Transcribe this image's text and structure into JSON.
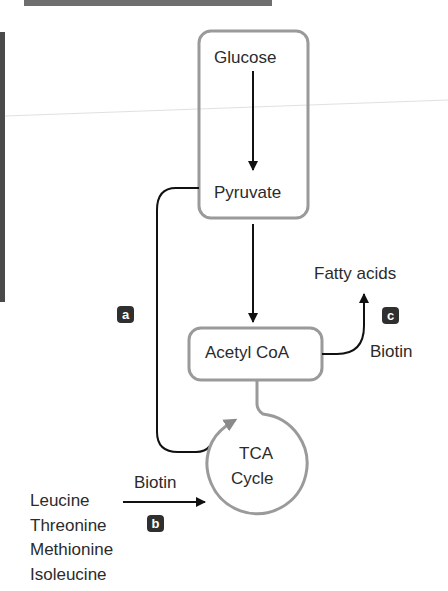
{
  "diagram": {
    "nodes": {
      "glucose": "Glucose",
      "pyruvate": "Pyruvate",
      "acetyl_coa": "Acetyl CoA",
      "tca_cycle_line1": "TCA",
      "tca_cycle_line2": "Cycle",
      "fatty_acids": "Fatty acids"
    },
    "cofactors": {
      "biotin_c": "Biotin",
      "biotin_b": "Biotin"
    },
    "amino_acids": [
      "Leucine",
      "Threonine",
      "Methionine",
      "Isoleucine"
    ],
    "badges": {
      "a": "a",
      "b": "b",
      "c": "c"
    },
    "colors": {
      "box_stroke": "#9a9a9a",
      "arrow": "#111111",
      "badge_bg": "#2f2f2f",
      "badge_text": "#ffffff"
    },
    "edges": [
      {
        "from": "Glucose",
        "to": "Pyruvate"
      },
      {
        "from": "Pyruvate",
        "to": "Acetyl CoA"
      },
      {
        "from": "Pyruvate",
        "to": "TCA Cycle",
        "label": "a"
      },
      {
        "from": "Acetyl CoA",
        "to": "TCA Cycle"
      },
      {
        "from": "Acetyl CoA",
        "to": "Fatty acids",
        "label": "c",
        "cofactor": "Biotin"
      },
      {
        "from": "Leucine/Threonine/Methionine/Isoleucine",
        "to": "TCA Cycle",
        "label": "b",
        "cofactor": "Biotin"
      }
    ]
  }
}
